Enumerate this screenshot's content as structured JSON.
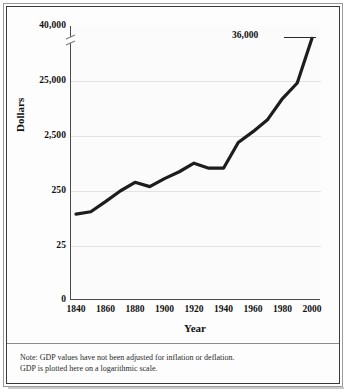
{
  "chart_data": {
    "type": "line",
    "title": "",
    "xlabel": "Year",
    "ylabel": "Dollars",
    "ytick_labels": [
      "40,000",
      "25,000",
      "2,500",
      "250",
      "25",
      "0"
    ],
    "xtick_labels": [
      "1840",
      "1860",
      "1880",
      "1900",
      "1920",
      "1940",
      "1960",
      "1980",
      "2000"
    ],
    "scale": "logarithmic",
    "grid": true,
    "legend": "none",
    "axis_break": true,
    "endpoint_annotation": "36,000",
    "x": [
      1840,
      1850,
      1860,
      1870,
      1880,
      1890,
      1900,
      1910,
      1920,
      1930,
      1940,
      1950,
      1960,
      1970,
      1980,
      1990,
      2000
    ],
    "values": [
      95,
      105,
      160,
      250,
      360,
      300,
      420,
      560,
      800,
      650,
      650,
      1900,
      3000,
      5000,
      12000,
      23000,
      36000
    ],
    "series": [
      {
        "name": "GDP per capita",
        "values": [
          95,
          105,
          160,
          250,
          360,
          300,
          420,
          560,
          800,
          650,
          650,
          1900,
          3000,
          5000,
          12000,
          23000,
          36000
        ]
      }
    ],
    "annotations": [
      "36,000"
    ]
  },
  "axis": {
    "y_title": "Dollars",
    "x_title": "Year"
  },
  "notes": {
    "line1": "Note: GDP values have not been adjusted for inflation or deflation.",
    "line2": "GDP is plotted here on a logarithmic scale."
  }
}
